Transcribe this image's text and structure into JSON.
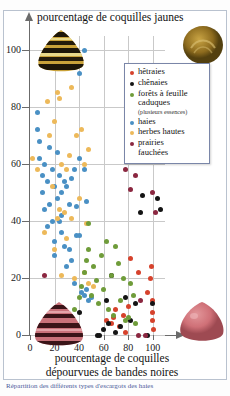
{
  "chart_data": {
    "type": "scatter",
    "title": "",
    "ylabel": "pourcentage de coquilles jaunes",
    "xlabel_line1": "pourcentage de coquilles",
    "xlabel_line2": "dépourvues de bandes noires",
    "xlim": [
      0,
      110
    ],
    "ylim": [
      0,
      105
    ],
    "xticks": [
      0,
      20,
      40,
      60,
      80,
      100
    ],
    "yticks": [
      0,
      20,
      40,
      60,
      80,
      100
    ],
    "grid": true,
    "legend_position": "upper-right-inside",
    "series": [
      {
        "name": "hêtraies",
        "color": "#d6422c",
        "points": [
          [
            62,
            5
          ],
          [
            66,
            4
          ],
          [
            68,
            6
          ],
          [
            70,
            9
          ],
          [
            73,
            3
          ],
          [
            76,
            7
          ],
          [
            78,
            1
          ],
          [
            80,
            10
          ],
          [
            82,
            27
          ],
          [
            88,
            22
          ],
          [
            96,
            15
          ],
          [
            98,
            20
          ],
          [
            99,
            24
          ],
          [
            100,
            12
          ],
          [
            100,
            8
          ],
          [
            100,
            5
          ],
          [
            101,
            2
          ]
        ]
      },
      {
        "name": "chênaies",
        "color": "#141414",
        "points": [
          [
            40,
            8
          ],
          [
            55,
            0
          ],
          [
            57,
            0
          ],
          [
            60,
            2
          ],
          [
            62,
            12
          ],
          [
            64,
            4
          ],
          [
            66,
            21
          ],
          [
            70,
            1
          ],
          [
            74,
            3
          ],
          [
            78,
            13
          ],
          [
            82,
            5
          ],
          [
            86,
            11
          ],
          [
            90,
            43
          ],
          [
            92,
            49
          ],
          [
            96,
            0
          ],
          [
            100,
            11
          ],
          [
            104,
            48
          ],
          [
            106,
            44
          ]
        ]
      },
      {
        "name": "forêts à feuille caduques",
        "color": "#6f9c3a",
        "points": [
          [
            30,
            6
          ],
          [
            34,
            4
          ],
          [
            36,
            9
          ],
          [
            40,
            13
          ],
          [
            42,
            17
          ],
          [
            44,
            22
          ],
          [
            46,
            26
          ],
          [
            48,
            30
          ],
          [
            48,
            39
          ],
          [
            50,
            14
          ],
          [
            52,
            24
          ],
          [
            54,
            19
          ],
          [
            56,
            11
          ],
          [
            58,
            28
          ],
          [
            60,
            16
          ],
          [
            62,
            33
          ],
          [
            64,
            9
          ],
          [
            66,
            21
          ],
          [
            68,
            7
          ],
          [
            70,
            31
          ],
          [
            72,
            25
          ],
          [
            74,
            12
          ],
          [
            76,
            20
          ],
          [
            78,
            5
          ],
          [
            80,
            6
          ],
          [
            82,
            18
          ],
          [
            84,
            14
          ],
          [
            86,
            4
          ]
        ]
      },
      {
        "name": "haies",
        "color": "#4a90c4"
      },
      {
        "name": "herbes hautes",
        "color": "#edb95a"
      },
      {
        "name": "prairies fauchées",
        "color": "#8b2740"
      }
    ],
    "haies_points": [
      [
        44,
        100
      ],
      [
        40,
        92
      ],
      [
        6,
        78
      ],
      [
        6,
        72
      ],
      [
        8,
        62
      ],
      [
        12,
        60
      ],
      [
        18,
        58
      ],
      [
        10,
        56
      ],
      [
        14,
        54
      ],
      [
        20,
        52
      ],
      [
        24,
        56
      ],
      [
        26,
        50
      ],
      [
        28,
        54
      ],
      [
        22,
        48
      ],
      [
        30,
        52
      ],
      [
        16,
        46
      ],
      [
        34,
        55
      ],
      [
        36,
        58
      ],
      [
        32,
        46
      ],
      [
        12,
        44
      ],
      [
        26,
        42
      ],
      [
        18,
        40
      ],
      [
        24,
        40
      ],
      [
        20,
        33
      ],
      [
        28,
        31
      ],
      [
        32,
        30
      ],
      [
        38,
        35
      ],
      [
        40,
        35
      ],
      [
        46,
        47
      ],
      [
        30,
        24
      ],
      [
        34,
        26
      ],
      [
        36,
        18
      ],
      [
        42,
        15
      ],
      [
        46,
        16
      ],
      [
        44,
        14
      ],
      [
        50,
        13
      ],
      [
        8,
        68
      ],
      [
        16,
        66
      ],
      [
        22,
        64
      ],
      [
        40,
        62
      ],
      [
        44,
        58
      ],
      [
        10,
        50
      ],
      [
        14,
        38
      ],
      [
        38,
        45
      ],
      [
        26,
        36
      ],
      [
        20,
        28
      ],
      [
        48,
        12
      ]
    ],
    "herbes_points": [
      [
        14,
        82
      ],
      [
        22,
        85
      ],
      [
        24,
        83
      ],
      [
        20,
        75
      ],
      [
        16,
        70
      ],
      [
        2,
        62
      ],
      [
        6,
        58
      ],
      [
        34,
        87
      ],
      [
        38,
        70
      ],
      [
        42,
        72
      ],
      [
        48,
        65
      ],
      [
        44,
        60
      ],
      [
        30,
        58
      ],
      [
        26,
        60
      ],
      [
        32,
        63
      ],
      [
        18,
        52
      ],
      [
        24,
        44
      ],
      [
        28,
        43
      ],
      [
        22,
        41
      ],
      [
        34,
        41
      ],
      [
        40,
        48
      ],
      [
        46,
        39
      ],
      [
        12,
        36
      ],
      [
        26,
        21
      ],
      [
        36,
        20
      ],
      [
        44,
        22
      ],
      [
        48,
        18
      ],
      [
        52,
        17
      ],
      [
        20,
        30
      ],
      [
        30,
        34
      ]
    ],
    "prairies_points": [
      [
        12,
        21
      ],
      [
        78,
        58
      ],
      [
        82,
        51
      ],
      [
        86,
        56
      ],
      [
        100,
        50
      ],
      [
        102,
        43
      ],
      [
        90,
        12
      ],
      [
        88,
        0
      ],
      [
        94,
        0
      ]
    ]
  },
  "legend": {
    "items": [
      {
        "label": "hêtraies",
        "sub": "",
        "color": "#d6422c"
      },
      {
        "label": "chênaies",
        "sub": "",
        "color": "#141414"
      },
      {
        "label": "forêts à feuille",
        "label2": "caduques",
        "sub": "(plusieurs essences)",
        "color": "#6f9c3a"
      },
      {
        "label": "haies",
        "sub": "",
        "color": "#4a90c4"
      },
      {
        "label": "herbes hautes",
        "sub": "",
        "color": "#edb95a"
      },
      {
        "label": "prairies",
        "label2": "fauchées",
        "sub": "",
        "color": "#8b2740"
      }
    ]
  },
  "caption": {
    "text": "Répartition des différents types d'escargots des haies"
  },
  "shells": {
    "top_left": "banded-yellow-shell",
    "top_right": "plain-yellow-shell",
    "bottom_left": "banded-pink-shell",
    "bottom_right": "plain-pink-shell"
  }
}
